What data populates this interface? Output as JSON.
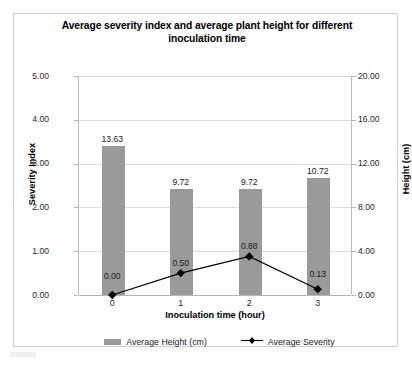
{
  "chart_data": {
    "type": "bar",
    "title": "Average severity index and average plant height for different inoculation time",
    "title_line1": "Average severity index and average plant height for different",
    "title_line2": "inoculation time",
    "xlabel": "Inoculation time (hour)",
    "ylabel": "Severity Index",
    "y2label": "Height (cm)",
    "categories": [
      "0",
      "1",
      "2",
      "3"
    ],
    "ylim": [
      0,
      5
    ],
    "y2lim": [
      0,
      20
    ],
    "yticks": [
      "0.00",
      "1.00",
      "2.00",
      "3.00",
      "4.00",
      "5.00"
    ],
    "y2ticks": [
      "0.00",
      "4.00",
      "8.00",
      "12.00",
      "16.00",
      "20.00"
    ],
    "grid": true,
    "legend_position": "bottom",
    "series": [
      {
        "name": "Average Height (cm)",
        "type": "bar",
        "axis": "right",
        "color": "#9a9a9a",
        "values": [
          13.63,
          9.72,
          9.72,
          10.72
        ],
        "labels": [
          "13.63",
          "9.72",
          "9.72",
          "10.72"
        ]
      },
      {
        "name": "Average Severity",
        "type": "line",
        "axis": "left",
        "color": "#000000",
        "marker": "diamond",
        "values": [
          0.0,
          0.5,
          0.88,
          0.13
        ],
        "labels": [
          "0.00",
          "0.50",
          "0.88",
          "0.13"
        ]
      }
    ]
  },
  "legend": {
    "items": [
      {
        "label": "Average Height (cm)",
        "marker": "bar-swatch"
      },
      {
        "label": "Average Severity",
        "marker": "line-diamond"
      }
    ]
  }
}
